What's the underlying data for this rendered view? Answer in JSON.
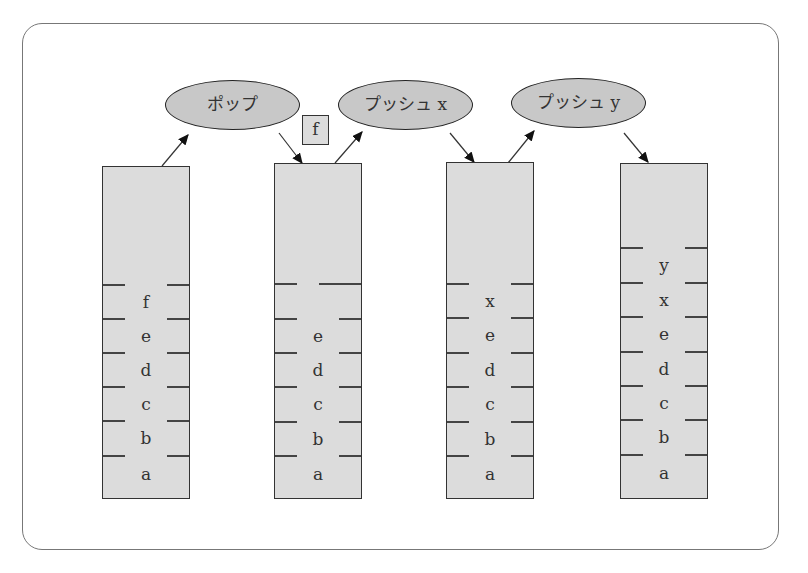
{
  "operations": [
    {
      "label": "ポップ"
    },
    {
      "label": "プッシュ x"
    },
    {
      "label": "プッシュ y"
    }
  ],
  "popped_item": "f",
  "stacks": [
    {
      "name": "stack-1",
      "items_top_to_bottom": [
        "f",
        "e",
        "d",
        "c",
        "b",
        "a"
      ]
    },
    {
      "name": "stack-2",
      "items_top_to_bottom": [
        "e",
        "d",
        "c",
        "b",
        "a"
      ]
    },
    {
      "name": "stack-3",
      "items_top_to_bottom": [
        "x",
        "e",
        "d",
        "c",
        "b",
        "a"
      ]
    },
    {
      "name": "stack-4",
      "items_top_to_bottom": [
        "y",
        "x",
        "e",
        "d",
        "c",
        "b",
        "a"
      ]
    }
  ],
  "colors": {
    "fill": "#dcdcdc",
    "oval_fill": "#c8c8c8",
    "stroke": "#333333"
  }
}
